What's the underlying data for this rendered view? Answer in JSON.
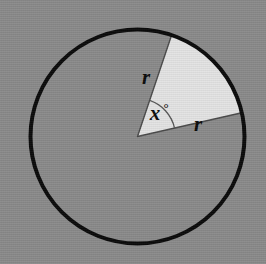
{
  "figure": {
    "background_color": "#8a8a8a",
    "labels": {
      "radius_upper": "r",
      "radius_lower": "r",
      "angle": "x",
      "degree_symbol": "°"
    },
    "colors": {
      "background": "#8a8a8a",
      "circle_interior": "#8a8a8a",
      "circle_outline": "#0a0a0a",
      "sector_fill": "#e3e3e3",
      "sector_outline": "#4a4a4a",
      "angle_arc": "#555555",
      "label_text": "#0b0b0b"
    },
    "geometry": {
      "center_x": 137.5,
      "center_y": 136.5,
      "radius": 107,
      "circle_stroke_width": 4,
      "sector_start_angle_deg": 12.8,
      "sector_end_angle_deg": 71.4,
      "sector_sweep_deg": 58.6,
      "angle_arc_radius": 38,
      "sector_stroke_width": 1.4
    },
    "label_positions": {
      "radius_upper": {
        "x": 146,
        "y": 84
      },
      "radius_lower": {
        "x": 198,
        "y": 131
      },
      "angle": {
        "x": 155,
        "y": 120
      },
      "degree_symbol": {
        "x": 168,
        "y": 113
      }
    }
  }
}
